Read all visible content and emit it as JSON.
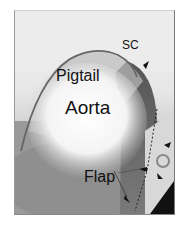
{
  "image": {
    "description": "Grayscale aortic angiogram showing pigtail catheter in aortic arch with dissection flap",
    "labels": {
      "sc": "SC",
      "pigtail": "Pigtail",
      "aorta": "Aorta",
      "flap": "Flap"
    }
  }
}
